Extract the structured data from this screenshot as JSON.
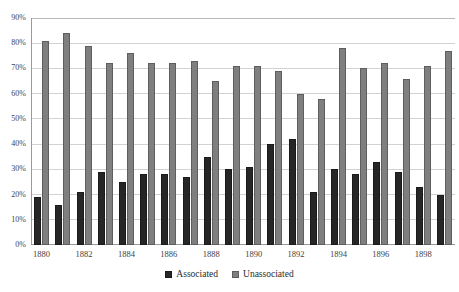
{
  "chart_data": {
    "type": "bar",
    "title": "",
    "xlabel": "",
    "ylabel": "",
    "ylim": [
      0,
      90
    ],
    "ytick_labels": [
      "90%",
      "80%",
      "70%",
      "60%",
      "50%",
      "40%",
      "30%",
      "20%",
      "10%",
      "0%"
    ],
    "ytick_values": [
      90,
      80,
      70,
      60,
      50,
      40,
      30,
      20,
      10,
      0
    ],
    "grid": true,
    "legend_position": "bottom",
    "categories": [
      "1880",
      "1881",
      "1882",
      "1883",
      "1884",
      "1885",
      "1886",
      "1887",
      "1888",
      "1889",
      "1890",
      "1891",
      "1892",
      "1893",
      "1894",
      "1895",
      "1896",
      "1897",
      "1898",
      "1899"
    ],
    "visible_tick_labels": [
      "1880",
      "",
      "1882",
      "",
      "1884",
      "",
      "1886",
      "",
      "1888",
      "",
      "1890",
      "",
      "1892",
      "",
      "1894",
      "",
      "1896",
      "",
      "1898",
      ""
    ],
    "series": [
      {
        "name": "Associated",
        "color": "#262626",
        "values": [
          19,
          16,
          21,
          29,
          25,
          28,
          28,
          27,
          35,
          30,
          31,
          40,
          42,
          21,
          30,
          28,
          33,
          29,
          23,
          20
        ]
      },
      {
        "name": "Unassociated",
        "color": "#7f7f7f",
        "values": [
          81,
          84,
          79,
          72,
          76,
          72,
          72,
          73,
          65,
          71,
          71,
          69,
          60,
          58,
          78,
          70,
          72,
          66,
          71,
          77
        ]
      }
    ]
  },
  "legend": {
    "items": [
      {
        "label": "Associated",
        "swatch": "assoc"
      },
      {
        "label": "Unassociated",
        "swatch": "unassoc"
      }
    ]
  }
}
